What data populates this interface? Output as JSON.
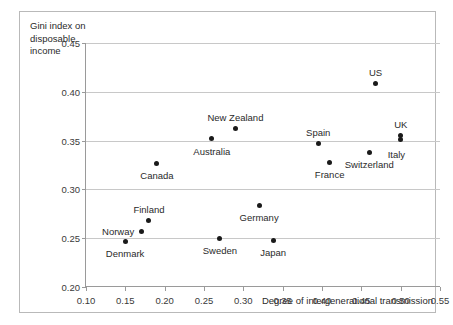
{
  "chart_data": {
    "type": "scatter",
    "title": "",
    "xlabel": "Degree of intergenerational transmission",
    "ylabel": "Gini index on disposable income",
    "ylabel_lines": [
      "Gini index on",
      "disposable",
      "income"
    ],
    "xlim": [
      0.1,
      0.55
    ],
    "ylim": [
      0.2,
      0.45
    ],
    "xticks": [
      "0.10",
      "0.15",
      "0.20",
      "0.25",
      "0.30",
      "0.35",
      "0.40",
      "0.45",
      "0.50",
      "0.55"
    ],
    "xtick_values": [
      0.1,
      0.15,
      0.2,
      0.25,
      0.3,
      0.35,
      0.4,
      0.45,
      0.5,
      0.55
    ],
    "yticks": [
      "0.20",
      "0.25",
      "0.30",
      "0.35",
      "0.40",
      "0.45"
    ],
    "ytick_values": [
      0.2,
      0.25,
      0.3,
      0.35,
      0.4,
      0.45
    ],
    "grid": "horizontal",
    "legend": "none",
    "marker_color": "#1a1a1a",
    "gridline_color": "#c8c8c8",
    "axis_color": "#9a9a9a",
    "frame_color": "#b9b9b9",
    "points": [
      {
        "label": "Denmark",
        "x": 0.15,
        "y": 0.247,
        "label_pos": "below"
      },
      {
        "label": "Norway",
        "x": 0.17,
        "y": 0.257,
        "label_pos": "left"
      },
      {
        "label": "Finland",
        "x": 0.18,
        "y": 0.268,
        "label_pos": "above"
      },
      {
        "label": "Canada",
        "x": 0.19,
        "y": 0.327,
        "label_pos": "below"
      },
      {
        "label": "Australia",
        "x": 0.26,
        "y": 0.352,
        "label_pos": "below"
      },
      {
        "label": "Sweden",
        "x": 0.27,
        "y": 0.25,
        "label_pos": "below"
      },
      {
        "label": "New Zealand",
        "x": 0.29,
        "y": 0.362,
        "label_pos": "above"
      },
      {
        "label": "Germany",
        "x": 0.32,
        "y": 0.284,
        "label_pos": "below"
      },
      {
        "label": "Japan",
        "x": 0.338,
        "y": 0.248,
        "label_pos": "below"
      },
      {
        "label": "Spain",
        "x": 0.395,
        "y": 0.347,
        "label_pos": "above"
      },
      {
        "label": "France",
        "x": 0.41,
        "y": 0.328,
        "label_pos": "below"
      },
      {
        "label": "Switzerland",
        "x": 0.46,
        "y": 0.338,
        "label_pos": "below"
      },
      {
        "label": "US",
        "x": 0.468,
        "y": 0.408,
        "label_pos": "above"
      },
      {
        "label": "UK",
        "x": 0.5,
        "y": 0.355,
        "label_pos": "above"
      },
      {
        "label": "Italy",
        "x": 0.5,
        "y": 0.351,
        "label_pos": "below-right"
      }
    ]
  }
}
